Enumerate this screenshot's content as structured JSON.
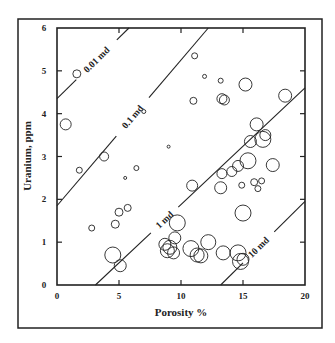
{
  "chart_data": {
    "type": "scatter",
    "title": "",
    "xlabel": "Porosity %",
    "ylabel": "Uranium, ppm",
    "xlim": [
      0,
      20
    ],
    "ylim": [
      0,
      6
    ],
    "xticks": [
      0,
      5,
      10,
      15,
      20
    ],
    "yticks": [
      0,
      1,
      2,
      3,
      4,
      5,
      6
    ],
    "grid": false,
    "legend": null,
    "marker": "open circle, size proportional to a third variable",
    "iso_permeability_lines": [
      {
        "label": "0.01 md",
        "x0": 0,
        "y0": 4.35,
        "x1": 5.8,
        "y1": 6.0
      },
      {
        "label": "0.1 md",
        "x0": 0,
        "y0": 1.85,
        "x1": 12.2,
        "y1": 6.0
      },
      {
        "label": "1 md",
        "x0": 3.1,
        "y0": 0,
        "x1": 20,
        "y1": 4.6
      },
      {
        "label": "10 md",
        "x0": 13.2,
        "y0": 0,
        "x1": 20,
        "y1": 1.95
      }
    ],
    "points": [
      {
        "x": 1.6,
        "y": 4.93,
        "r": 4
      },
      {
        "x": 0.7,
        "y": 3.75,
        "r": 5.5
      },
      {
        "x": 3.8,
        "y": 3.0,
        "r": 4.5
      },
      {
        "x": 1.8,
        "y": 2.68,
        "r": 3
      },
      {
        "x": 2.8,
        "y": 1.33,
        "r": 3
      },
      {
        "x": 4.7,
        "y": 1.42,
        "r": 4
      },
      {
        "x": 5.0,
        "y": 1.7,
        "r": 4
      },
      {
        "x": 5.7,
        "y": 1.8,
        "r": 3.5
      },
      {
        "x": 5.5,
        "y": 2.5,
        "r": 1.5
      },
      {
        "x": 6.4,
        "y": 2.73,
        "r": 2.5
      },
      {
        "x": 7.0,
        "y": 4.05,
        "r": 2
      },
      {
        "x": 9.0,
        "y": 3.23,
        "r": 1.5
      },
      {
        "x": 11.1,
        "y": 5.35,
        "r": 3
      },
      {
        "x": 11.9,
        "y": 4.87,
        "r": 2
      },
      {
        "x": 11.0,
        "y": 4.3,
        "r": 3.5
      },
      {
        "x": 13.2,
        "y": 4.77,
        "r": 2.5
      },
      {
        "x": 13.3,
        "y": 4.35,
        "r": 5
      },
      {
        "x": 13.5,
        "y": 4.32,
        "r": 5
      },
      {
        "x": 15.2,
        "y": 4.68,
        "r": 6.5
      },
      {
        "x": 18.4,
        "y": 4.42,
        "r": 6.5
      },
      {
        "x": 4.5,
        "y": 0.7,
        "r": 8
      },
      {
        "x": 5.1,
        "y": 0.45,
        "r": 6
      },
      {
        "x": 8.7,
        "y": 0.95,
        "r": 6
      },
      {
        "x": 8.9,
        "y": 0.8,
        "r": 7
      },
      {
        "x": 9.1,
        "y": 0.88,
        "r": 7
      },
      {
        "x": 9.4,
        "y": 0.75,
        "r": 6
      },
      {
        "x": 9.5,
        "y": 1.1,
        "r": 6
      },
      {
        "x": 9.7,
        "y": 1.45,
        "r": 8
      },
      {
        "x": 10.8,
        "y": 0.85,
        "r": 8
      },
      {
        "x": 11.3,
        "y": 0.7,
        "r": 7
      },
      {
        "x": 11.6,
        "y": 0.68,
        "r": 7
      },
      {
        "x": 12.2,
        "y": 1.0,
        "r": 7.5
      },
      {
        "x": 13.4,
        "y": 0.75,
        "r": 7
      },
      {
        "x": 14.6,
        "y": 0.75,
        "r": 8
      },
      {
        "x": 14.8,
        "y": 0.55,
        "r": 8
      },
      {
        "x": 15.0,
        "y": 0.6,
        "r": 6
      },
      {
        "x": 10.9,
        "y": 2.32,
        "r": 5.5
      },
      {
        "x": 13.2,
        "y": 2.27,
        "r": 6
      },
      {
        "x": 13.3,
        "y": 2.6,
        "r": 5
      },
      {
        "x": 14.1,
        "y": 2.65,
        "r": 5
      },
      {
        "x": 14.6,
        "y": 2.78,
        "r": 5.5
      },
      {
        "x": 14.9,
        "y": 2.33,
        "r": 3
      },
      {
        "x": 15.0,
        "y": 1.68,
        "r": 8
      },
      {
        "x": 15.4,
        "y": 2.9,
        "r": 8
      },
      {
        "x": 15.6,
        "y": 3.35,
        "r": 6
      },
      {
        "x": 15.9,
        "y": 2.4,
        "r": 3.5
      },
      {
        "x": 16.2,
        "y": 2.25,
        "r": 3
      },
      {
        "x": 16.5,
        "y": 2.43,
        "r": 3
      },
      {
        "x": 16.1,
        "y": 3.75,
        "r": 6.5
      },
      {
        "x": 16.6,
        "y": 3.4,
        "r": 8
      },
      {
        "x": 16.8,
        "y": 3.5,
        "r": 5.5
      },
      {
        "x": 17.4,
        "y": 2.8,
        "r": 6.5
      }
    ]
  }
}
